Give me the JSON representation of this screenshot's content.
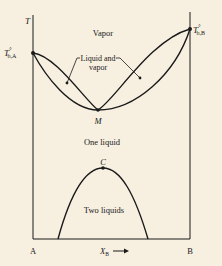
{
  "diagram": {
    "type": "phase-diagram",
    "axes": {
      "y_label": "T",
      "x_label": "X",
      "x_label_subscript": "B",
      "x_arrow": "→",
      "left_end": "A",
      "right_end": "B"
    },
    "points": {
      "tba": {
        "label": "T",
        "superscript": "°",
        "subscript": "b,A"
      },
      "tbb": {
        "label": "T",
        "superscript": "°",
        "subscript": "b,B"
      },
      "azeotrope": {
        "label": "M"
      },
      "critical": {
        "label": "C"
      }
    },
    "regions": {
      "vapor": "Vapor",
      "liquid_vapor_line1": "Liquid and",
      "liquid_vapor_line2": "vapor",
      "one_liquid": "One liquid",
      "two_liquids": "Two liquids"
    },
    "colors": {
      "background": "#f7f0e1",
      "ink": "#1a1a1a"
    }
  }
}
